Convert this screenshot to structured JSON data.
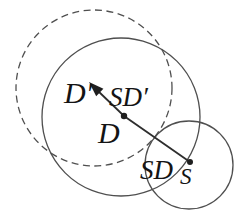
{
  "diagram": {
    "background": "#ffffff",
    "circle_stroke": "#4f4f4f",
    "line_stroke": "#2e2e2e",
    "marker_fill": "#1f1f1f",
    "text_color": "#141414",
    "dashed_circle": {
      "cx": 94,
      "cy": 88,
      "r": 78,
      "dash": "7 4.5"
    },
    "large_circle": {
      "cx": 121,
      "cy": 117,
      "r": 79
    },
    "small_circle": {
      "cx": 189,
      "cy": 165,
      "r": 44
    },
    "path": {
      "line_points": "190,162 124,116 97,90",
      "arrow_points": "89,82 103.4,88.7 96.2,96.2"
    },
    "points": {
      "s_dot": {
        "cx": 190,
        "cy": 162,
        "r": 3
      },
      "d_dot": {
        "cx": 124,
        "cy": 116,
        "r": 3.2
      }
    },
    "labels": {
      "d_prime": {
        "text": "D′",
        "x": 64,
        "y": 103,
        "size": 30
      },
      "sd_prime": {
        "text": "SD′",
        "x": 109,
        "y": 106,
        "size": 27
      },
      "d": {
        "text": "D",
        "x": 98,
        "y": 143,
        "size": 30
      },
      "sd": {
        "text": "SD",
        "x": 140,
        "y": 179,
        "size": 27
      },
      "s": {
        "text": "S",
        "x": 180,
        "y": 184,
        "size": 23
      }
    }
  }
}
